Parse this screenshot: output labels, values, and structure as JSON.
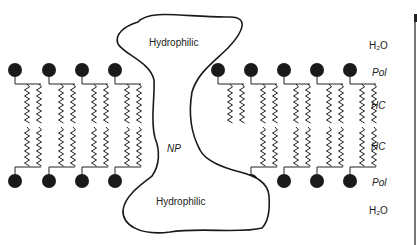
{
  "diagram": {
    "title": "",
    "protein": {
      "top_label": "Hydrophilic",
      "middle_label": "NP",
      "bottom_label": "Hydrophilic"
    },
    "layer_labels": [
      {
        "text": "H₂O",
        "y": 47
      },
      {
        "text": "Pol",
        "y": 73,
        "italic": true
      },
      {
        "text": "HC",
        "y": 107,
        "italic": true
      },
      {
        "text": "HC",
        "y": 147,
        "italic": true
      },
      {
        "text": "Pol",
        "y": 183,
        "italic": true
      },
      {
        "text": "H₂O",
        "y": 212
      }
    ],
    "lipids": {
      "top_heads_x": [
        25,
        59,
        92,
        125,
        228,
        261,
        294,
        327,
        360
      ],
      "bottom_heads_x": [
        25,
        59,
        92,
        125,
        261,
        294,
        327,
        360
      ],
      "top_head_y": 70,
      "bottom_head_y": 181,
      "head_color": "#1a1a1a"
    }
  }
}
